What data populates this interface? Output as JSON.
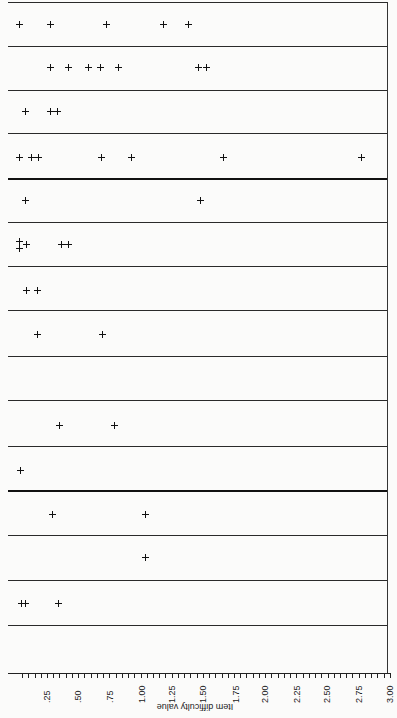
{
  "chart_data": {
    "type": "scatter",
    "title": "",
    "xlabel": "Item difficulty value",
    "ylabel": "",
    "xlim": [
      0,
      3.0
    ],
    "x_ticks": [
      ".25",
      ".50",
      ".75",
      "1.00",
      "1.25",
      "1.50",
      "1.75",
      "2.00",
      "2.25",
      "2.50",
      "2.75",
      "3.00"
    ],
    "minor_tick_step": 0.05,
    "grid": "horizontal row separators",
    "orientation_note": "page rotated; x-axis at bottom, tick labels read bottom-to-top, axis title upside-down",
    "rows": [
      {
        "row": 1,
        "values": [
          0.03,
          0.28,
          0.72,
          1.18,
          1.38
        ]
      },
      {
        "row": 2,
        "values": [
          0.28,
          0.42,
          0.58,
          0.68,
          0.82,
          1.46,
          1.53
        ]
      },
      {
        "row": 3,
        "values": [
          0.07,
          0.28,
          0.33
        ]
      },
      {
        "row": 4,
        "values": [
          0.03,
          0.12,
          0.18,
          0.68,
          0.92,
          1.66,
          2.77
        ]
      },
      {
        "row": 5,
        "values": [
          0.07,
          1.48
        ]
      },
      {
        "row": 6,
        "values": [
          0.03,
          0.03,
          0.08,
          0.36,
          0.42
        ]
      },
      {
        "row": 7,
        "values": [
          0.08,
          0.17
        ]
      },
      {
        "row": 8,
        "values": [
          0.17,
          0.69
        ]
      },
      {
        "row": 9,
        "values": []
      },
      {
        "row": 10,
        "values": [
          0.35,
          0.79
        ]
      },
      {
        "row": 11,
        "values": [
          0.03
        ]
      },
      {
        "row": 12,
        "values": [
          0.29,
          1.04
        ]
      },
      {
        "row": 13,
        "values": [
          1.04
        ]
      },
      {
        "row": 14,
        "values": [
          0.04,
          0.07,
          0.34
        ]
      }
    ],
    "thick_separators_after_rows": [
      4,
      11
    ]
  },
  "layout": {
    "px_per_unit": 124.7,
    "x_zero_px": 15.8,
    "row_lines_y": [
      2,
      46,
      90,
      133,
      178,
      222,
      266,
      310,
      356,
      400,
      446,
      490,
      535,
      580,
      625
    ],
    "thick_lines_y": [
      178,
      490
    ],
    "row_centers_y": [
      24,
      67,
      111,
      157,
      200,
      244,
      290,
      334,
      378,
      425,
      469,
      514,
      557,
      603
    ]
  },
  "points_px": [
    [
      19,
      24
    ],
    [
      50,
      24
    ],
    [
      106,
      24
    ],
    [
      163,
      24
    ],
    [
      188,
      24
    ],
    [
      50,
      67
    ],
    [
      68,
      67
    ],
    [
      88,
      67
    ],
    [
      100,
      67
    ],
    [
      118,
      67
    ],
    [
      198,
      67
    ],
    [
      206,
      67
    ],
    [
      25,
      111
    ],
    [
      50,
      111
    ],
    [
      57,
      111
    ],
    [
      19,
      157
    ],
    [
      31,
      157
    ],
    [
      38,
      157
    ],
    [
      101,
      157
    ],
    [
      131,
      157
    ],
    [
      223,
      157
    ],
    [
      361,
      157
    ],
    [
      25,
      200
    ],
    [
      200,
      200
    ],
    [
      19,
      241
    ],
    [
      19,
      248
    ],
    [
      26,
      244
    ],
    [
      61,
      244
    ],
    [
      68,
      244
    ],
    [
      26,
      290
    ],
    [
      37,
      290
    ],
    [
      37,
      334
    ],
    [
      102,
      334
    ],
    [
      59,
      425
    ],
    [
      114,
      425
    ],
    [
      20,
      470
    ],
    [
      52,
      514
    ],
    [
      145,
      514
    ],
    [
      145,
      557
    ],
    [
      21,
      603
    ],
    [
      25,
      603
    ],
    [
      58,
      603
    ]
  ],
  "tick_px": [
    47,
    78,
    110,
    142,
    172,
    203,
    236,
    265,
    297,
    327,
    359,
    390
  ]
}
